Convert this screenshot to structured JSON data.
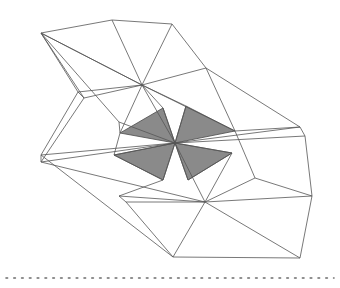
{
  "figure": {
    "canvas": {
      "width": 340,
      "height": 288,
      "background": "#ffffff"
    },
    "style": {
      "line_color": "#555555",
      "line_width": 0.8,
      "shaded_fill": "#8a8a8a",
      "shaded_stroke": "#4a4a4a",
      "dotted_color": "#6b6b6b"
    },
    "vertices": {
      "top_left_apex": [
        41,
        33
      ],
      "top_mid": [
        112,
        20
      ],
      "top_right": [
        172,
        24
      ],
      "upper_right_edge": [
        206,
        68
      ],
      "upper_hub": [
        142,
        85
      ],
      "center_hub": [
        175,
        143
      ],
      "lower_hub": [
        205,
        202
      ],
      "left_apex_upper": [
        41,
        155
      ],
      "left_apex_lower": [
        41,
        162
      ],
      "right_tip_upper": [
        300,
        127
      ],
      "right_tip_lower": [
        305,
        136
      ],
      "bottom_apex": [
        173,
        257
      ],
      "bottom_right": [
        300,
        258
      ],
      "left_notch": [
        78,
        92
      ],
      "left_notch_b": [
        84,
        98
      ],
      "mid_left_fold": [
        119,
        196
      ],
      "mid_left_fold_b": [
        126,
        202
      ],
      "right_lower_edge": [
        255,
        178
      ],
      "right_far_edge": [
        312,
        196
      ]
    },
    "shaded_facets": [
      {
        "name": "facet-upper-left",
        "points": "120,133 163,108 175,143"
      },
      {
        "name": "facet-upper-right",
        "points": "175,143 186,106 235,131"
      },
      {
        "name": "facet-lower-left",
        "points": "175,143 163,180 114,155"
      },
      {
        "name": "facet-lower-right",
        "points": "175,143 232,153 188,180"
      }
    ],
    "wire_paths": [
      "M41,33 L112,20 L172,24 L206,68 L142,85 Z",
      "M41,33 L142,85",
      "M112,20 L142,85",
      "M172,24 L142,85",
      "M41,33 L78,92",
      "M41,33 L84,98",
      "M41,33 L119,122",
      "M78,92 L84,98",
      "M78,92 L142,85",
      "M84,98 L142,85",
      "M142,85 L175,143",
      "M142,85 L120,133",
      "M142,85 L163,108",
      "M142,85 L186,106",
      "M142,85 L235,131",
      "M206,68 L235,131",
      "M206,68 L300,127",
      "M235,131 L300,127",
      "M175,143 L300,127",
      "M175,143 L305,136",
      "M300,127 L305,136",
      "M41,155 L175,143",
      "M41,162 L175,143",
      "M41,155 L41,162",
      "M78,92 L41,155",
      "M84,98 L41,162",
      "M41,155 L173,257",
      "M41,162 L205,202",
      "M119,122 L120,133",
      "M119,122 L175,143",
      "M120,133 L114,155",
      "M114,155 L175,143",
      "M163,108 L175,143",
      "M186,106 L175,143",
      "M232,153 L175,143",
      "M163,180 L175,143",
      "M188,180 L175,143",
      "M175,143 L205,202",
      "M163,180 L114,155",
      "M188,180 L232,153",
      "M119,196 L126,202",
      "M119,196 L205,202",
      "M126,202 L205,202",
      "M119,196 L163,180",
      "M126,202 L173,257",
      "M173,257 L205,202",
      "M205,202 L255,178",
      "M205,202 L312,196",
      "M205,202 L300,258",
      "M255,178 L312,196",
      "M235,131 L255,178",
      "M305,136 L312,196",
      "M173,257 L300,258",
      "M300,258 L312,196",
      "M232,153 L205,202"
    ],
    "dotted_line": {
      "name": "baseline-dotted-rule",
      "y": 278,
      "x_start": 6,
      "x_end": 334,
      "dash": "1.6 6.2"
    }
  }
}
